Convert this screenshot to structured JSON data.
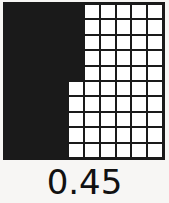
{
  "figure": {
    "kind": "decimal-hundredths-grid",
    "label": "0.45",
    "colors": {
      "filled": "#1a1a1a",
      "empty": "#ffffff",
      "gridline": "#1a1a1a",
      "background": "#f7f6f4",
      "label_text": "#111111"
    }
  },
  "chart_data": {
    "type": "heatmap",
    "title": "0.45",
    "xlabel": "",
    "ylabel": "",
    "rows": 10,
    "columns": 10,
    "total_cells": 100,
    "filled_cells": 45,
    "empty_cells": 55,
    "fraction": "45/100",
    "decimal_value": 0.45,
    "percent": 45,
    "legend": [
      {
        "name": "filled",
        "value": 1,
        "color": "#1a1a1a"
      },
      {
        "name": "empty",
        "value": 0,
        "color": "#ffffff"
      }
    ],
    "row_fill_counts": [
      5,
      5,
      5,
      5,
      5,
      4,
      4,
      4,
      4,
      4
    ],
    "values": [
      [
        1,
        1,
        1,
        1,
        1,
        0,
        0,
        0,
        0,
        0
      ],
      [
        1,
        1,
        1,
        1,
        1,
        0,
        0,
        0,
        0,
        0
      ],
      [
        1,
        1,
        1,
        1,
        1,
        0,
        0,
        0,
        0,
        0
      ],
      [
        1,
        1,
        1,
        1,
        1,
        0,
        0,
        0,
        0,
        0
      ],
      [
        1,
        1,
        1,
        1,
        1,
        0,
        0,
        0,
        0,
        0
      ],
      [
        1,
        1,
        1,
        1,
        0,
        0,
        0,
        0,
        0,
        0
      ],
      [
        1,
        1,
        1,
        1,
        0,
        0,
        0,
        0,
        0,
        0
      ],
      [
        1,
        1,
        1,
        1,
        0,
        0,
        0,
        0,
        0,
        0
      ],
      [
        1,
        1,
        1,
        1,
        0,
        0,
        0,
        0,
        0,
        0
      ],
      [
        1,
        1,
        1,
        1,
        0,
        0,
        0,
        0,
        0,
        0
      ]
    ]
  }
}
